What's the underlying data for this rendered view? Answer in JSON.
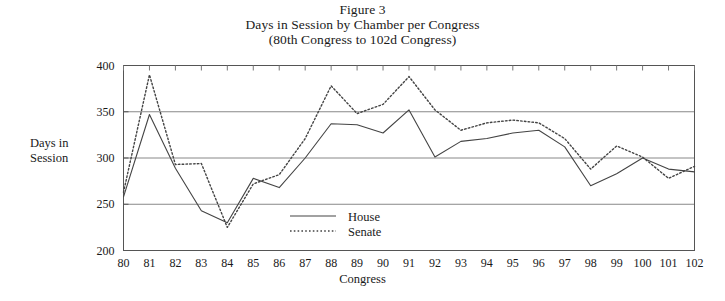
{
  "figure": {
    "title_lines": [
      "Figure 3",
      "Days in Session by Chamber per Congress",
      "(80th Congress to 102d Congress)"
    ]
  },
  "chart_data": {
    "type": "line",
    "title": "Days in Session by Chamber per Congress",
    "subtitle": "(80th Congress to 102d Congress)",
    "figure_number": "Figure 3",
    "xlabel": "Congress",
    "ylabel": "Days in Session",
    "categories": [
      "80",
      "81",
      "82",
      "83",
      "84",
      "85",
      "86",
      "87",
      "88",
      "89",
      "90",
      "91",
      "92",
      "93",
      "94",
      "95",
      "96",
      "97",
      "98",
      "99",
      "100",
      "101",
      "102"
    ],
    "x": [
      80,
      81,
      82,
      83,
      84,
      85,
      86,
      87,
      88,
      89,
      90,
      91,
      92,
      93,
      94,
      95,
      96,
      97,
      98,
      99,
      100,
      101,
      102
    ],
    "ylim": [
      200,
      400
    ],
    "yticks": [
      200,
      250,
      300,
      350,
      400
    ],
    "xlim": [
      80,
      102
    ],
    "grid": "horizontal",
    "legend_position": "bottom-center",
    "series": [
      {
        "name": "House",
        "style": "solid",
        "color": "#444444",
        "values": [
          258,
          347,
          289,
          243,
          230,
          278,
          268,
          300,
          337,
          336,
          327,
          352,
          301,
          318,
          321,
          327,
          330,
          312,
          270,
          283,
          300,
          288,
          285
        ]
      },
      {
        "name": "Senate",
        "style": "dotted",
        "color": "#444444",
        "values": [
          263,
          390,
          293,
          294,
          225,
          272,
          282,
          321,
          378,
          348,
          358,
          388,
          352,
          330,
          338,
          341,
          338,
          321,
          288,
          313,
          301,
          278,
          291
        ]
      }
    ]
  },
  "legend": {
    "items": [
      {
        "label": "House",
        "style": "solid"
      },
      {
        "label": "Senate",
        "style": "dotted"
      }
    ]
  }
}
